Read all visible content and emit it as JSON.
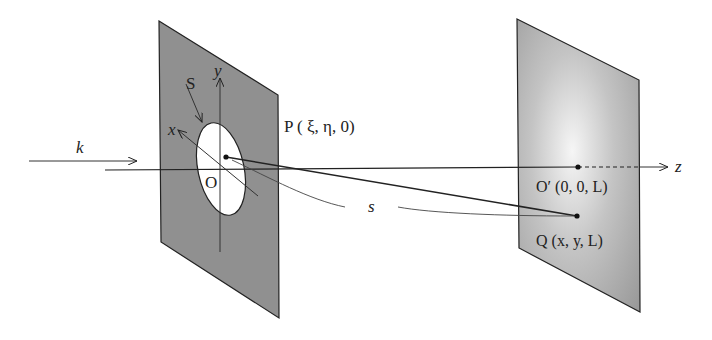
{
  "diagram": {
    "type": "fraunhofer-fresnel-diffraction-geometry",
    "labels": {
      "wave_vector": "k",
      "aperture": "S",
      "y_axis": "y",
      "x_axis": "x",
      "origin": "O",
      "point_p": "P ( ξ, η, 0)",
      "distance": "s",
      "origin_screen": "O′ (0, 0, L)",
      "point_q": "Q (x, y, L)",
      "z_axis": "z"
    },
    "colors": {
      "aperture_plane": "#8f8f8f",
      "screen_edge": "#9a9a9a",
      "screen_center": "#f4f4f4",
      "line": "#222222"
    }
  }
}
